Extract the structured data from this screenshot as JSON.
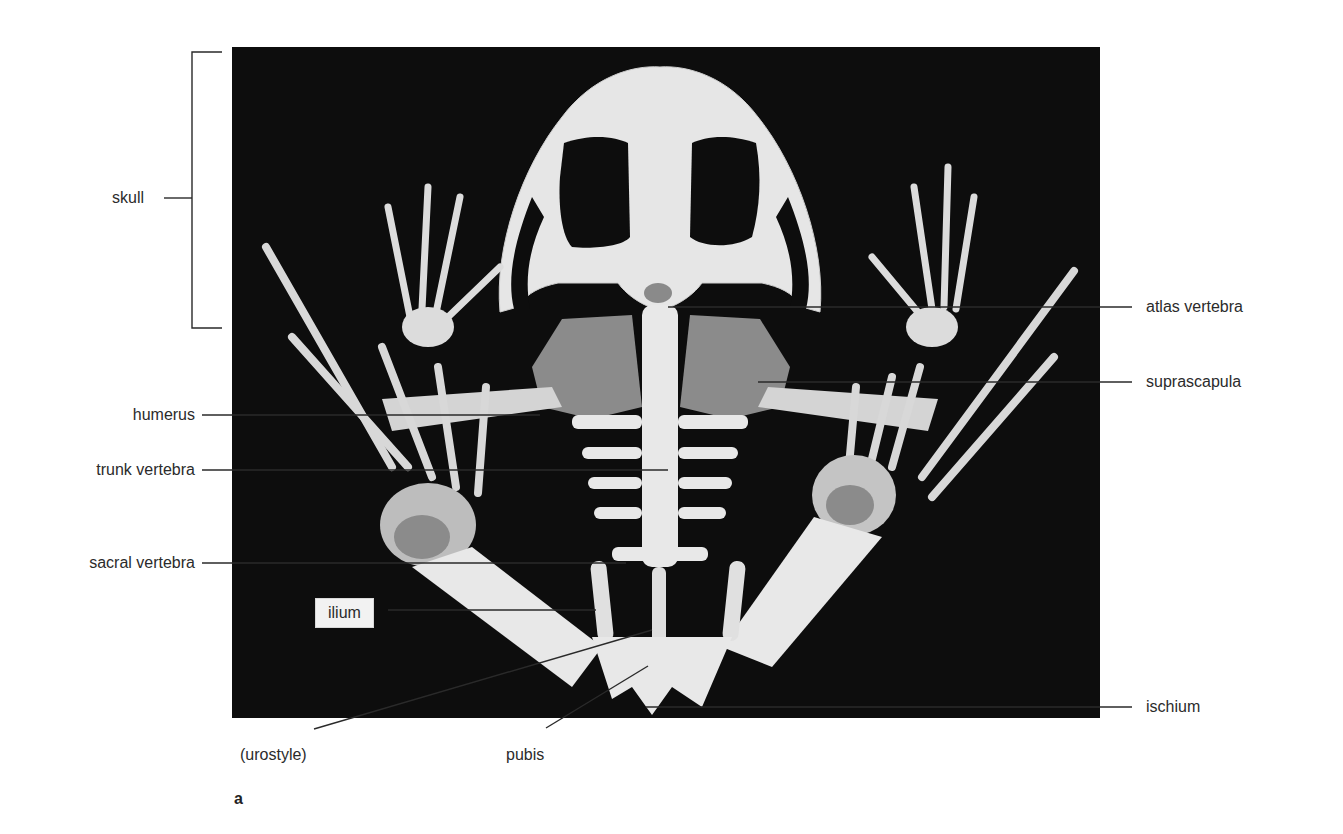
{
  "figure": {
    "panel_letter": "a",
    "colors": {
      "background": "#ffffff",
      "photo_background": "#0d0d0d",
      "bone": "#e8e8e8",
      "cartilage": "#8a8a8a",
      "leader_line": "#2a2a2a",
      "label_text": "#2b2b2b",
      "label_box": "#f2f2f2"
    }
  },
  "labels": {
    "skull": "skull",
    "humerus": "humerus",
    "trunk_vertebra": "trunk vertebra",
    "sacral_vertebra": "sacral vertebra",
    "ilium": "ilium",
    "urostyle": "(urostyle)",
    "pubis": "pubis",
    "atlas_vertebra": "atlas vertebra",
    "suprascapula": "suprascapula",
    "ischium": "ischium"
  }
}
